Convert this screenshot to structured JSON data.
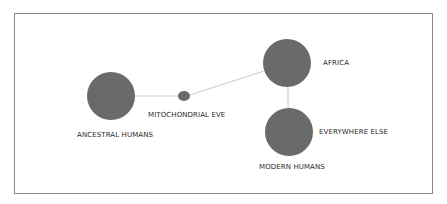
{
  "diagram": {
    "colors": {
      "node_fill": "#6a6a6a",
      "edge_stroke": "#cfcfcf",
      "frame_border": "#8a8a8a",
      "label_text": "#2a2a2a"
    },
    "nodes": [
      {
        "id": "ancestral",
        "label": "ANCESTRAL HUMANS",
        "cx": 111,
        "cy": 96,
        "r": 24
      },
      {
        "id": "eve",
        "label": "MITOCHONDRIAL EVE",
        "cx": 184,
        "cy": 96,
        "rx": 6,
        "ry": 5
      },
      {
        "id": "africa",
        "label": "AFRICA",
        "cx": 287,
        "cy": 63,
        "r": 24
      },
      {
        "id": "modern",
        "label": "MODERN HUMANS",
        "secondary_label": "EVERYWHERE ELSE",
        "cx": 289,
        "cy": 132,
        "r": 24
      }
    ],
    "edges": [
      {
        "from": "ancestral",
        "to": "eve"
      },
      {
        "from": "eve",
        "to": "africa"
      },
      {
        "from": "africa",
        "to": "modern"
      }
    ],
    "labels": {
      "ancestral_humans": "ANCESTRAL HUMANS",
      "mitochondrial_eve": "MITOCHONDRIAL EVE",
      "africa": "AFRICA",
      "everywhere_else": "EVERYWHERE ELSE",
      "modern_humans": "MODERN HUMANS"
    }
  }
}
